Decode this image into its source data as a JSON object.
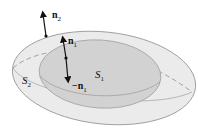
{
  "figure": {
    "surfaces": [
      {
        "id": "S1",
        "label": "S",
        "subscript": "1",
        "role": "inner surface",
        "fill": "#d2d2d2"
      },
      {
        "id": "S2",
        "label": "S",
        "subscript": "2",
        "role": "outer surface",
        "fill": "#ebebeb"
      }
    ],
    "vectors": [
      {
        "id": "n2",
        "label": "n",
        "subscript": "2",
        "direction": "outward from S2"
      },
      {
        "id": "n1",
        "label": "n",
        "subscript": "1",
        "direction": "outward from S1"
      },
      {
        "id": "neg_n1",
        "label": "−n",
        "subscript": "1",
        "direction": "inward from S1"
      }
    ],
    "colors": {
      "outer_fill": "#ebebeb",
      "inner_fill": "#d2d2d2",
      "outline": "#9a9a9a",
      "arrow": "#111111",
      "background": "#ffffff"
    }
  }
}
